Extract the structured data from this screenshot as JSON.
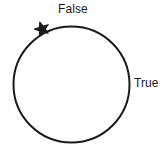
{
  "diagram": {
    "type": "circle-loop-diagram",
    "background_color": "#ffffff",
    "stroke_color": "#1a1a1a",
    "text_color": "#1a1a1a",
    "circle": {
      "name": "loop-circle",
      "center_x": 71.5,
      "center_y": 84.5,
      "radius": 58,
      "stroke_width": 2,
      "fill": "none"
    },
    "marker": {
      "name": "star-marker",
      "shape": "star",
      "points": 5,
      "center_x": 42,
      "center_y": 29,
      "size": 13,
      "color": "#1a1a1a"
    },
    "labels": [
      {
        "id": "false",
        "text": "False",
        "x": 58,
        "y": 3,
        "position": "top"
      },
      {
        "id": "true",
        "text": "True",
        "x": 134,
        "y": 77,
        "position": "right"
      }
    ]
  },
  "chart_data": {
    "type": "diagram",
    "title": "",
    "shapes": [
      "circle",
      "star"
    ],
    "annotations": [
      "False",
      "True"
    ]
  }
}
